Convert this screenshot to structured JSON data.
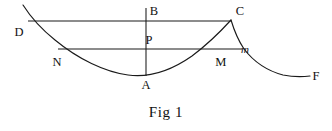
{
  "figure": {
    "caption": "Fig 1",
    "caption_position": {
      "y": 104
    },
    "background_color": "#ffffff",
    "stroke_color": "#1a1a1a",
    "width": 332,
    "height": 131,
    "labels": [
      {
        "key": "D",
        "text": "D",
        "x": 19,
        "y": 32,
        "italic": false
      },
      {
        "key": "B",
        "text": "B",
        "x": 154,
        "y": 11,
        "italic": false
      },
      {
        "key": "C",
        "text": "C",
        "x": 240,
        "y": 11,
        "italic": false
      },
      {
        "key": "P",
        "text": "P",
        "x": 149,
        "y": 40,
        "italic": false
      },
      {
        "key": "m",
        "text": "m",
        "x": 245,
        "y": 49,
        "italic": true
      },
      {
        "key": "N",
        "text": "N",
        "x": 57,
        "y": 62,
        "italic": false
      },
      {
        "key": "M",
        "text": "M",
        "x": 221,
        "y": 62,
        "italic": false
      },
      {
        "key": "A",
        "text": "A",
        "x": 146,
        "y": 85,
        "italic": false
      },
      {
        "key": "F",
        "text": "F",
        "x": 316,
        "y": 76,
        "italic": false
      }
    ],
    "segments": [
      {
        "key": "line-DC",
        "name": "horizontal-line-D-C",
        "x1": 28,
        "y1": 21,
        "x2": 231,
        "y2": 21
      },
      {
        "key": "line-Nm",
        "name": "horizontal-line-N-m",
        "x1": 58,
        "y1": 49,
        "x2": 242,
        "y2": 49
      },
      {
        "key": "line-BA",
        "name": "vertical-line-B-A",
        "x1": 146,
        "y1": 8,
        "x2": 146,
        "y2": 76
      }
    ],
    "curves": [
      {
        "key": "curve-DNAMC",
        "name": "main-cycloid-arc-D-N-A-M-C",
        "path": "M 23 5 C 30 16 40 28 55 40 C 78 59 105 72 128 75 C 150 78 172 70 192 56 C 208 44 221 31 231 20"
      },
      {
        "key": "curve-CmF",
        "name": "descending-arc-C-m-F",
        "path": "M 231 20 C 234 30 238 40 244 49 C 254 62 268 71 283 75 C 293 77 302 77 310 76"
      }
    ]
  }
}
